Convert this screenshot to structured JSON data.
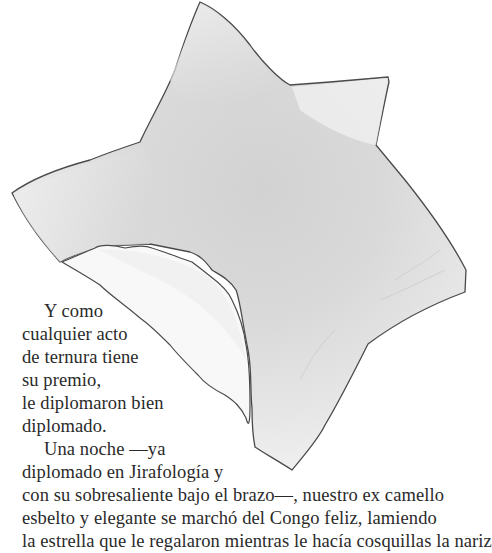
{
  "illustration": {
    "subject": "star-shaped watercolor illustration with a bite taken out",
    "colors": {
      "paper": "#ffffff",
      "star_light": "#ededed",
      "star_mid": "#dcdcdc",
      "star_dark": "#cfcfcf",
      "bite": "#f7f7f7",
      "outline": "#4a4a4a",
      "text": "#2a2a2a"
    }
  },
  "text": {
    "lines": [
      {
        "text": "Y como",
        "indent": true
      },
      {
        "text": "cualquier acto",
        "indent": false
      },
      {
        "text": "de ternura tiene",
        "indent": false
      },
      {
        "text": "su premio,",
        "indent": false
      },
      {
        "text": "le diplomaron bien",
        "indent": false
      },
      {
        "text": "diplomado.",
        "indent": false
      },
      {
        "text": "Una noche —ya",
        "indent": true
      },
      {
        "text": "diplomado en Jirafología y",
        "indent": false
      },
      {
        "text": "con su sobresaliente bajo el brazo—, nuestro ex camello",
        "indent": false
      },
      {
        "text": "esbelto y elegante se marchó del Congo feliz, lamiendo",
        "indent": false
      },
      {
        "text": "la estrella que le regalaron mientras le hacía cosquillas la nariz",
        "indent": false
      }
    ]
  }
}
